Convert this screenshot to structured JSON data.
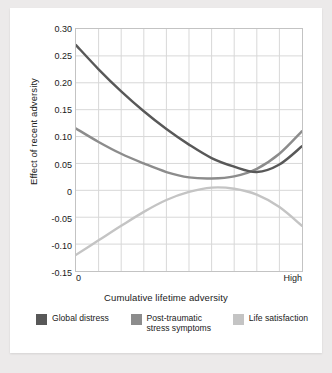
{
  "chart_data": {
    "type": "line",
    "title": "",
    "xlabel": "Cumulative lifetime adversity",
    "ylabel": "Effect of recent adversity",
    "xlim": [
      0,
      1
    ],
    "ylim": [
      -0.15,
      0.3
    ],
    "grid": true,
    "x_tick_labels": [
      "0",
      "High"
    ],
    "y_tick_labels": [
      "0.30",
      "0.25",
      "0.20",
      "0.15",
      "0.10",
      "0.05",
      "0",
      "-0.05",
      "-0.10",
      "-0.15"
    ],
    "y_tick_values": [
      0.3,
      0.25,
      0.2,
      0.15,
      0.1,
      0.05,
      0,
      -0.05,
      -0.1,
      -0.15
    ],
    "x_gridlines": 9,
    "legend_position": "bottom",
    "series": [
      {
        "name": "Global distress",
        "color": "#585858",
        "x": [
          0,
          0.1,
          0.2,
          0.3,
          0.4,
          0.5,
          0.6,
          0.7,
          0.8,
          0.9,
          1
        ],
        "values": [
          0.27,
          0.225,
          0.184,
          0.147,
          0.114,
          0.085,
          0.06,
          0.044,
          0.034,
          0.048,
          0.082
        ]
      },
      {
        "name": "Post-traumatic\nstress symptoms",
        "color": "#8c8c8c",
        "x": [
          0,
          0.1,
          0.2,
          0.3,
          0.4,
          0.5,
          0.6,
          0.7,
          0.8,
          0.9,
          1
        ],
        "values": [
          0.115,
          0.09,
          0.068,
          0.05,
          0.034,
          0.024,
          0.022,
          0.026,
          0.04,
          0.068,
          0.11
        ]
      },
      {
        "name": "Life satisfaction",
        "color": "#c4c4c4",
        "x": [
          0,
          0.1,
          0.2,
          0.3,
          0.4,
          0.5,
          0.6,
          0.7,
          0.8,
          0.9,
          1
        ],
        "values": [
          -0.12,
          -0.093,
          -0.066,
          -0.04,
          -0.018,
          -0.003,
          0.005,
          0.003,
          -0.008,
          -0.031,
          -0.066
        ]
      }
    ]
  },
  "axes": {
    "y_title": "Effect of recent adversity",
    "x_title": "Cumulative lifetime adversity",
    "x_low_label": "0",
    "x_high_label": "High",
    "y_labels": [
      "0.30",
      "0.25",
      "0.20",
      "0.15",
      "0.10",
      "0.05",
      "0",
      "-0.05",
      "-0.10",
      "-0.15"
    ]
  },
  "legend": {
    "items": [
      {
        "label": "Global distress",
        "color": "#585858"
      },
      {
        "label": "Post-traumatic\nstress symptoms",
        "color": "#8c8c8c"
      },
      {
        "label": "Life satisfaction",
        "color": "#c4c4c4"
      }
    ]
  }
}
